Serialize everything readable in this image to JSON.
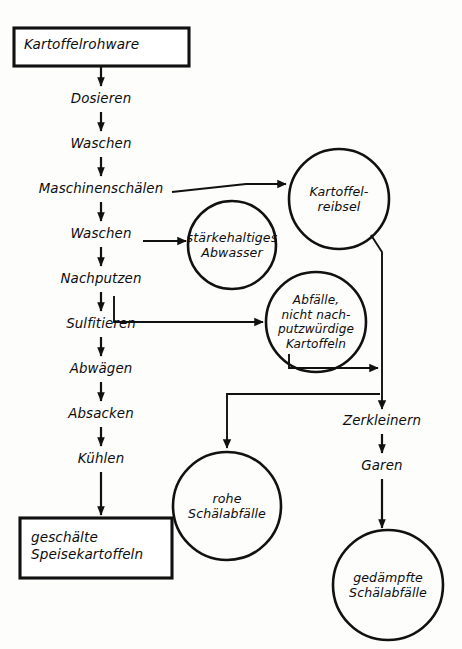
{
  "diagram": {
    "language": "de",
    "colors": {
      "stroke": "#111111",
      "background": "#fdfdfc",
      "text": "#0d0d0d"
    }
  },
  "terminals": [
    {
      "id": "start",
      "label": "Kartoffelrohware",
      "shape": "rectangle"
    },
    {
      "id": "end",
      "label_line1": "geschälte",
      "label_line2": "Speisekartoffeln",
      "shape": "rectangle"
    }
  ],
  "steps": [
    {
      "id": "dosieren",
      "label": "Dosieren"
    },
    {
      "id": "waschen1",
      "label": "Waschen"
    },
    {
      "id": "maschinenschaelen",
      "label": "Maschinenschälen"
    },
    {
      "id": "waschen2",
      "label": "Waschen"
    },
    {
      "id": "nachputzen",
      "label": "Nachputzen"
    },
    {
      "id": "sulfitieren",
      "label": "Sulfitieren"
    },
    {
      "id": "abwaegen",
      "label": "Abwägen"
    },
    {
      "id": "absacken",
      "label": "Absacken"
    },
    {
      "id": "kuehlen",
      "label": "Kühlen"
    },
    {
      "id": "zerkleinern",
      "label": "Zerkleinern"
    },
    {
      "id": "garen",
      "label": "Garen"
    }
  ],
  "circles": [
    {
      "id": "kartoffelreibsel",
      "lines": [
        "Kartoffel-",
        "reibsel"
      ],
      "shape": "circle"
    },
    {
      "id": "staerkehaltiges-abwasser",
      "lines": [
        "stärkehaltiges",
        "Abwasser"
      ],
      "shape": "circle"
    },
    {
      "id": "abfaelle",
      "lines": [
        "Abfälle,",
        "nicht nach-",
        "putzwürdige",
        "Kartoffeln"
      ],
      "shape": "circle"
    },
    {
      "id": "rohe-schaelabfaelle",
      "lines": [
        "rohe",
        "Schälabfälle"
      ],
      "shape": "circle"
    },
    {
      "id": "gedaempfte-schaelabfaelle",
      "lines": [
        "gedämpfte",
        "Schälabfälle"
      ],
      "shape": "circle"
    }
  ]
}
